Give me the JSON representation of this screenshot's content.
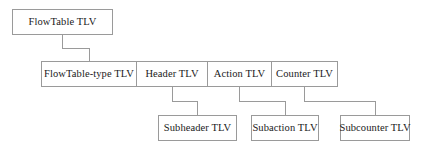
{
  "diagram": {
    "type": "hierarchy-tree",
    "colors": {
      "box_border": "#9a9a9a",
      "connector": "#9a9a9a",
      "text": "#1a1a1a",
      "background": "#ffffff"
    },
    "rows": {
      "root": {
        "nodes": [
          {
            "id": "flowtable-tlv",
            "label": "FlowTable TLV",
            "x": 12,
            "y": 9,
            "w": 101,
            "h": 26
          }
        ]
      },
      "level1": {
        "nodes": [
          {
            "id": "flowtable-type-tlv",
            "label": "FlowTable-type TLV",
            "x": 41,
            "y": 61,
            "w": 96,
            "h": 26
          },
          {
            "id": "header-tlv",
            "label": "Header TLV",
            "x": 136,
            "y": 61,
            "w": 72,
            "h": 26
          },
          {
            "id": "action-tlv",
            "label": "Action TLV",
            "x": 207,
            "y": 61,
            "w": 65,
            "h": 26
          },
          {
            "id": "counter-tlv",
            "label": "Counter TLV",
            "x": 271,
            "y": 61,
            "w": 67,
            "h": 26
          }
        ]
      },
      "level2": {
        "nodes": [
          {
            "id": "subheader-tlv",
            "label": "Subheader TLV",
            "x": 158,
            "y": 115,
            "w": 79,
            "h": 26
          },
          {
            "id": "subaction-tlv",
            "label": "Subaction TLV",
            "x": 251,
            "y": 115,
            "w": 68,
            "h": 26
          },
          {
            "id": "subcounter-tlv",
            "label": "Subcounter TLV",
            "x": 340,
            "y": 115,
            "w": 70,
            "h": 26
          }
        ]
      }
    },
    "connectors": [
      {
        "id": "flowtable-to-flowtable-type",
        "from": "flowtable-tlv",
        "to": "flowtable-type-tlv",
        "path": "M 62.5 35 L 62.5 48.5 L 89.5 48.5 L 89.5 61"
      },
      {
        "id": "header-to-subheader",
        "from": "header-tlv",
        "to": "subheader-tlv",
        "path": "M 172.5 87 L 172.5 101.5 L 197.5 101.5 L 197.5 115"
      },
      {
        "id": "action-to-subaction",
        "from": "action-tlv",
        "to": "subaction-tlv",
        "path": "M 239.5 87 L 239.5 101.5 L 285.5 101.5 L 285.5 115"
      },
      {
        "id": "counter-to-subcounter",
        "from": "counter-tlv",
        "to": "subcounter-tlv",
        "path": "M 304.5 87 L 304.5 101.5 L 375.5 101.5 L 375.5 115"
      }
    ]
  }
}
